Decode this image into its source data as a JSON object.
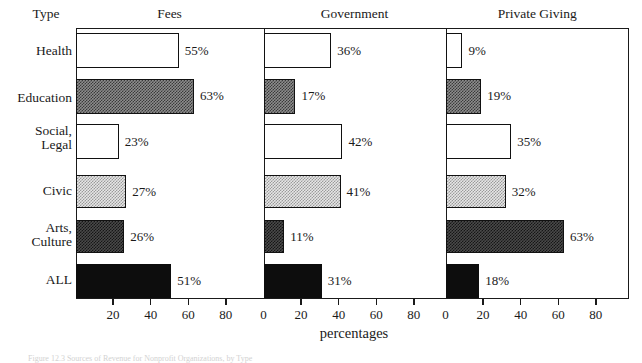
{
  "row_header_label": "Type",
  "x_axis_title": "percentages",
  "figure_caption": "Figure 12.3 Sources of Revenue for Nonprofit Organizations, by Type",
  "chart_data": {
    "type": "bar",
    "orientation": "horizontal",
    "title": "",
    "xlabel": "percentages",
    "ylabel": "Type",
    "xlim": [
      0,
      100
    ],
    "xticks": [
      0,
      20,
      40,
      60,
      80
    ],
    "grid": false,
    "legend": "none",
    "panel_layout": "three side-by-side panels sharing category axis",
    "categories": [
      "Health",
      "Education",
      "Social, Legal",
      "Civic",
      "Arts, Culture",
      "ALL"
    ],
    "category_lines": [
      [
        "Health"
      ],
      [
        "Education"
      ],
      [
        "Social,",
        "Legal"
      ],
      [
        "Civic"
      ],
      [
        "Arts,",
        "Culture"
      ],
      [
        "ALL"
      ]
    ],
    "panels": [
      {
        "name": "Fees",
        "values": [
          55,
          63,
          23,
          27,
          26,
          51
        ],
        "value_labels": [
          "55%",
          "63%",
          "23%",
          "27%",
          "26%",
          "51%"
        ],
        "tick_labels": [
          "",
          "20",
          "40",
          "60",
          "80"
        ]
      },
      {
        "name": "Government",
        "values": [
          36,
          17,
          42,
          41,
          11,
          31
        ],
        "value_labels": [
          "36%",
          "17%",
          "42%",
          "41%",
          "11%",
          "31%"
        ],
        "tick_labels": [
          "0",
          "20",
          "40",
          "60",
          "80"
        ]
      },
      {
        "name": "Private Giving",
        "values": [
          9,
          19,
          35,
          32,
          63,
          18
        ],
        "value_labels": [
          "9%",
          "19%",
          "35%",
          "32%",
          "63%",
          "18%"
        ],
        "tick_labels": [
          "0",
          "20",
          "40",
          "60",
          "80"
        ]
      }
    ],
    "series_fill_styles": [
      "white",
      "checker-dark",
      "white",
      "checker-light",
      "checker-darker",
      "black"
    ],
    "colors": {
      "axis": "#1a1a1a",
      "bar_outline": "#111111",
      "fill_white": "#ffffff",
      "fill_black": "#0d0d0d",
      "fill_checker_dark": "#3a3a3a",
      "fill_checker_light": "#9a9a9a",
      "fill_checker_darker": "#161616"
    }
  }
}
